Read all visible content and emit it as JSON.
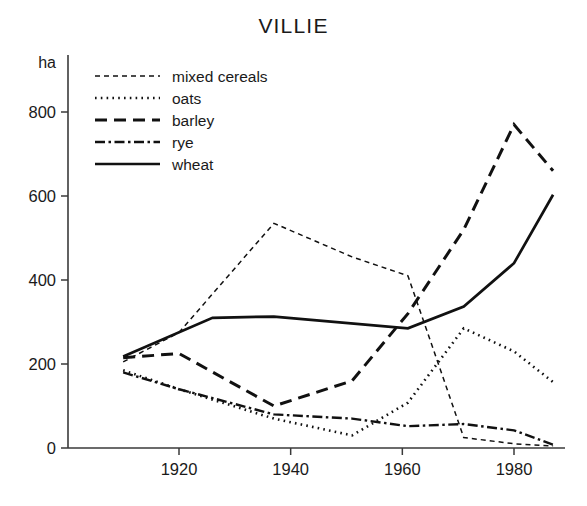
{
  "chart_data": {
    "type": "line",
    "title": "VILLIE",
    "xlabel": "",
    "ylabel": "ha",
    "unit_label": "ha",
    "xlim": [
      1907,
      1987
    ],
    "ylim": [
      0,
      860
    ],
    "xticks": [
      1920,
      1940,
      1960,
      1980
    ],
    "yticks": [
      0,
      200,
      400,
      600,
      800
    ],
    "grid": false,
    "legend_position": "top-left",
    "series": [
      {
        "name": "mixed cereals",
        "style": "fine-dashed",
        "dasharray": "5,4",
        "width": 1.5,
        "x": [
          1910,
          1920,
          1937,
          1951,
          1961,
          1971,
          1980,
          1987
        ],
        "values": [
          205,
          275,
          535,
          455,
          410,
          25,
          10,
          5
        ]
      },
      {
        "name": "oats",
        "style": "dotted",
        "dasharray": "1.6,4.2",
        "width": 2.6,
        "x": [
          1910,
          1920,
          1937,
          1951,
          1961,
          1971,
          1980,
          1987
        ],
        "values": [
          185,
          140,
          70,
          30,
          108,
          285,
          230,
          157
        ]
      },
      {
        "name": "barley",
        "style": "long-dashed",
        "dasharray": "12,7",
        "width": 3.0,
        "x": [
          1910,
          1920,
          1937,
          1951,
          1961,
          1971,
          1980,
          1987
        ],
        "values": [
          215,
          225,
          100,
          160,
          320,
          520,
          770,
          660
        ]
      },
      {
        "name": "rye",
        "style": "dash-dot",
        "dasharray": "10,3.5,2.5,3.5",
        "width": 2.4,
        "x": [
          1910,
          1920,
          1937,
          1951,
          1961,
          1971,
          1980,
          1987
        ],
        "values": [
          180,
          140,
          80,
          70,
          52,
          57,
          42,
          8
        ]
      },
      {
        "name": "wheat",
        "style": "solid",
        "dasharray": "none",
        "width": 2.7,
        "x": [
          1910,
          1926,
          1937,
          1961,
          1971,
          1980,
          1987
        ],
        "values": [
          218,
          310,
          313,
          285,
          337,
          440,
          603
        ]
      }
    ]
  },
  "legend": {
    "items": [
      {
        "label": "mixed cereals"
      },
      {
        "label": "oats"
      },
      {
        "label": "barley"
      },
      {
        "label": "rye"
      },
      {
        "label": "wheat"
      }
    ]
  }
}
